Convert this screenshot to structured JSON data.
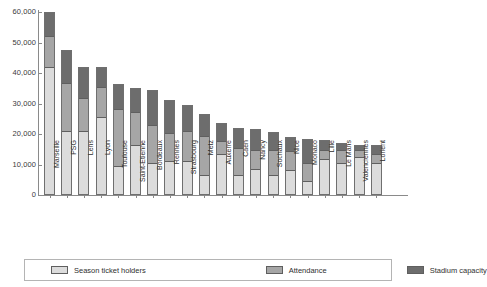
{
  "chart_data": {
    "type": "bar",
    "subtype": "stacked-overlay",
    "title": "",
    "xlabel": "",
    "ylabel": "",
    "ylim": [
      0,
      60000
    ],
    "ytick_values": [
      0,
      10000,
      20000,
      30000,
      40000,
      50000,
      60000
    ],
    "ytick_labels": [
      "0",
      "10,000",
      "20,000",
      "30,000",
      "40,000",
      "50,000",
      "60,000"
    ],
    "grid": false,
    "legend_position": "bottom",
    "categories": [
      "Marseille",
      "PSG",
      "Lens",
      "Lyon",
      "Toulouse",
      "Saint-Etienne",
      "Bordeaux",
      "Rennes",
      "Strasbourg",
      "Metz",
      "Auxerre",
      "Caen",
      "Nancy",
      "Sochaux",
      "Nice",
      "Monaco",
      "Lille",
      "Le Mans",
      "Valenciennes",
      "Lorient"
    ],
    "series": [
      {
        "name": "Season ticket holders",
        "color": "#dcdcdc",
        "values": [
          42000,
          21000,
          21000,
          25500,
          9500,
          16500,
          10500,
          11000,
          11000,
          6500,
          13500,
          6500,
          8500,
          6500,
          8000,
          4500,
          12000,
          10500,
          12500,
          10500
        ]
      },
      {
        "name": "Attendance",
        "color": "#a6a6a6",
        "values": [
          52500,
          37000,
          32000,
          35500,
          28500,
          27500,
          23000,
          20500,
          21000,
          19500,
          18000,
          15500,
          15000,
          15000,
          14500,
          10500,
          15000,
          15000,
          15000,
          13500
        ]
      },
      {
        "name": "Stadium capacity",
        "color": "#6d6d6d",
        "values": [
          60000,
          47500,
          42000,
          42000,
          36500,
          35000,
          34500,
          31000,
          29500,
          26500,
          23500,
          22000,
          21500,
          20500,
          19000,
          18500,
          18000,
          17000,
          16500,
          16500
        ]
      }
    ]
  },
  "legend": {
    "items": [
      {
        "label": "Season ticket holders",
        "swatch": "season-swatch"
      },
      {
        "label": "Attendance",
        "swatch": "attendance-swatch"
      },
      {
        "label": "Stadium capacity",
        "swatch": "capacity-swatch"
      }
    ]
  }
}
